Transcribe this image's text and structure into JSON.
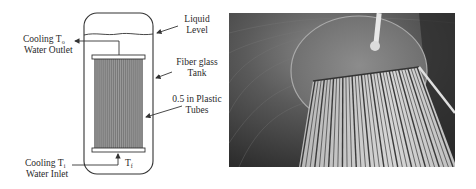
{
  "schematic": {
    "labels": {
      "outlet_line1": "Cooling",
      "outlet_temp": "T",
      "outlet_temp_sub": "o",
      "outlet_line2": "Water Outlet",
      "inlet_line1": "Cooling",
      "inlet_temp": "T",
      "inlet_temp_sub": "i",
      "inlet_line2": "Water Inlet",
      "feed_temp": "T",
      "feed_temp_sub": "f",
      "liquid_level_line1": "Liquid",
      "liquid_level_line2": "Level",
      "tank_line1": "Fiber glass",
      "tank_line2": "Tank",
      "tubes_line1": "0.5 in Plastic",
      "tubes_line2": "Tubes"
    },
    "colors": {
      "line": "#333333",
      "tube_fill": "#9a9a9a",
      "tube_stripe": "#6e6e6e"
    },
    "tube_count": 24
  },
  "photo": {
    "description": "Photograph of plastic tube bundle heat exchanger inside tank",
    "colors": {
      "dark": "#2e2e2e",
      "mid": "#6a6a6a",
      "light": "#d8d8d8"
    }
  }
}
